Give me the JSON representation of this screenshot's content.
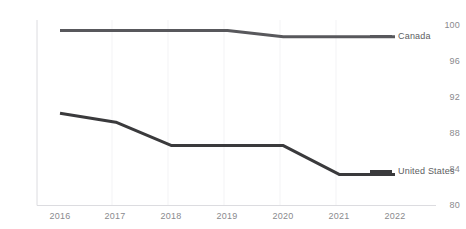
{
  "chart_data": {
    "type": "line",
    "title": "",
    "xlabel": "",
    "ylabel": "",
    "x": [
      2016,
      2017,
      2018,
      2019,
      2020,
      2021,
      2022
    ],
    "xtick_labels": [
      "2016",
      "2017",
      "2018",
      "2019",
      "2020",
      "2021",
      "2022"
    ],
    "ytick_labels": [
      "100",
      "96",
      "92",
      "88",
      "84",
      "80"
    ],
    "yticks": [
      100,
      96,
      92,
      88,
      84,
      80
    ],
    "ylim": [
      80,
      100
    ],
    "grid": false,
    "legend_position": "right-inline",
    "series": [
      {
        "name": "Canada",
        "color": "#58585c",
        "values": [
          99.4,
          99.4,
          99.4,
          99.4,
          98.7,
          98.7,
          98.7
        ]
      },
      {
        "name": "United States",
        "color": "#3a3a3c",
        "values": [
          90.2,
          89.2,
          86.6,
          86.6,
          86.6,
          83.4,
          83.4
        ]
      }
    ]
  },
  "axis": {
    "y_labels": [
      "100",
      "96",
      "92",
      "88",
      "84",
      "80"
    ],
    "x_labels": [
      "2016",
      "2017",
      "2018",
      "2019",
      "2020",
      "2021",
      "2022"
    ]
  },
  "legend": {
    "canada_label": "Canada",
    "united_states_label": "United States"
  },
  "colors": {
    "canada": "#58585c",
    "united_states": "#3a3a3c",
    "axis_text": "#8a8a8e",
    "axis_line": "#dcdce0"
  }
}
